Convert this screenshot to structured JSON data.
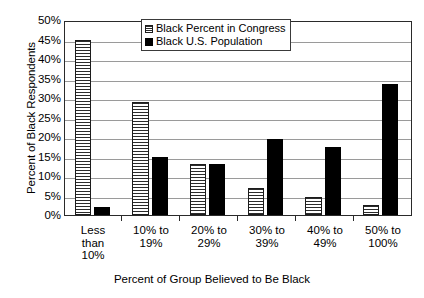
{
  "chart_data": {
    "type": "bar",
    "title": "",
    "xlabel": "Percent of Group Believed to Be Black",
    "ylabel": "Percent of Black Respondents",
    "categories": [
      "Less than 10%",
      "10% to 19%",
      "20% to 29%",
      "30% to 39%",
      "40% to 49%",
      "50% to 100%"
    ],
    "category_lines": [
      [
        "Less",
        "than",
        "10%"
      ],
      [
        "10% to",
        "19%"
      ],
      [
        "20% to",
        "29%"
      ],
      [
        "30% to",
        "39%"
      ],
      [
        "40% to",
        "49%"
      ],
      [
        "50% to",
        "100%"
      ]
    ],
    "series": [
      {
        "name": "Black Percent in Congress",
        "fill": "horizontal-hatch",
        "color": "#ffffff",
        "values": [
          45,
          29,
          13,
          7,
          4.5,
          2.5
        ]
      },
      {
        "name": "Black U.S. Population",
        "fill": "solid",
        "color": "#000000",
        "values": [
          2,
          15,
          13,
          19.5,
          17.5,
          33.5
        ]
      }
    ],
    "ylim": [
      0,
      50
    ],
    "ytick_step": 5,
    "ytick_labels": [
      "50%",
      "45%",
      "40%",
      "35%",
      "30%",
      "25%",
      "20%",
      "15%",
      "10%",
      "5%",
      "0%"
    ],
    "grid": true,
    "legend_position": "top-center"
  }
}
